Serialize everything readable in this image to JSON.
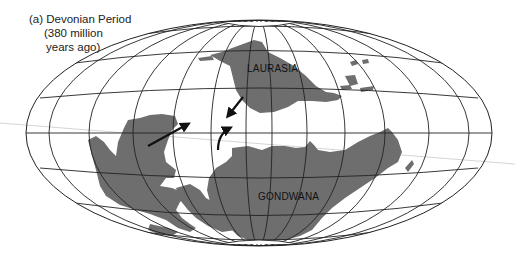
{
  "figure": {
    "caption_lines": [
      "(a) Devonian Period",
      "(380 million",
      "years ago)"
    ],
    "projection": "elliptical world map graticule",
    "continents": [
      {
        "name": "LAURASIA",
        "label": "LAURASIA"
      },
      {
        "name": "GONDWANA",
        "label": "GONDWANA"
      }
    ],
    "arrows": [
      {
        "description": "arrow pointing northeast toward center",
        "type": "straight"
      },
      {
        "description": "arrow from Laurasia pointing southwest",
        "type": "straight"
      },
      {
        "description": "curved arrow from Gondwana pointing north",
        "type": "curved"
      }
    ],
    "colors": {
      "land": "#6e6e6e",
      "ocean": "#ffffff",
      "grid": "#222222",
      "stray_line": "#cfcfcf"
    }
  }
}
